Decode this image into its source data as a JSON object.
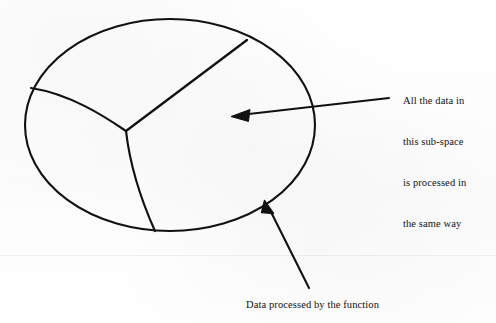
{
  "figure": {
    "title_text_blocks": {
      "subspace_note": {
        "lines": [
          "All the data in",
          "this sub-space",
          "is processed in",
          "the same way"
        ],
        "full_text": "All the data in this sub-space is processed in the same way"
      },
      "function_caption": {
        "text": "Data processed by the function"
      }
    },
    "shapes": {
      "outer_region_name": "data-space-ellipse",
      "partitions": [
        "straight-divider-upper-right",
        "curved-divider-left",
        "curved-divider-lower"
      ],
      "junction_label": "partition-junction-point"
    },
    "annotations": [
      {
        "name": "subspace-pointer-arrow",
        "points_to": "interior-right-sub-space"
      },
      {
        "name": "function-pointer-arrow",
        "points_to": "ellipse-boundary-lower-right"
      }
    ],
    "colors": {
      "ink": "#111111",
      "paper": "#fdfdfd"
    }
  }
}
